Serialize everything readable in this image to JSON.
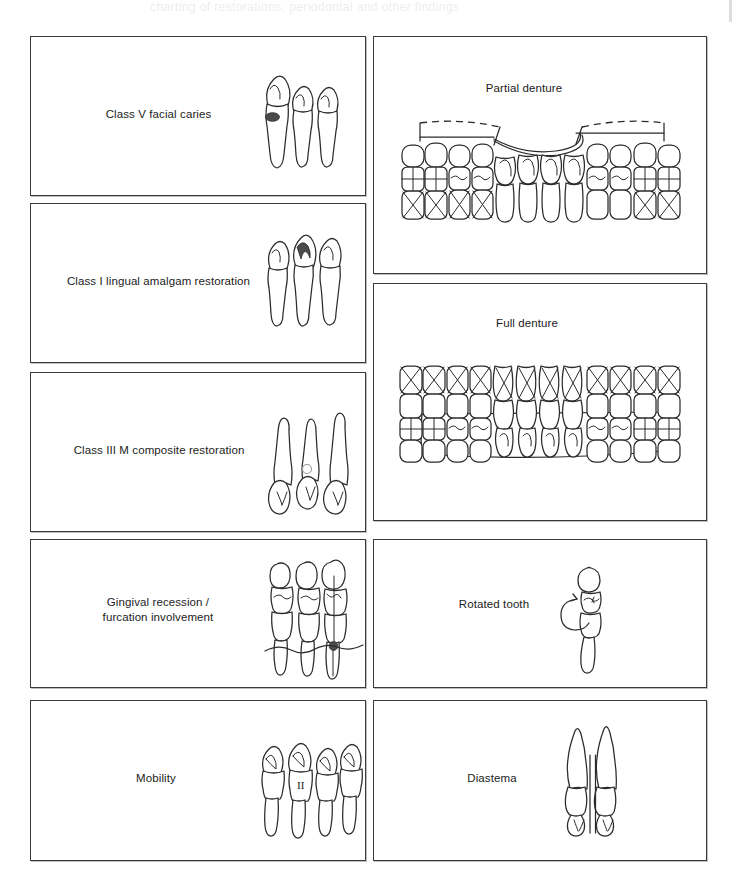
{
  "page": {
    "background_color": "#ffffff",
    "ink_color": "#2b2b2b",
    "ghost_header_artifact": "charting of restorations, periodontal and other findings",
    "panel_border_color": "#3a3a3a"
  },
  "panels": [
    {
      "id": "class-v-facial-caries",
      "label": "Class V facial caries",
      "column": "left",
      "art": "three-anterior-teeth-facial-lesion",
      "marking": {
        "type": "filled-lesion",
        "color": "#4a4a4a",
        "tooth_index": 1,
        "position": "cervical-facial"
      },
      "tooth_count": 3
    },
    {
      "id": "class-i-lingual-amalgam-restoration",
      "label": "Class I lingual amalgam restoration",
      "column": "left",
      "art": "three-anterior-teeth-lingual-amalgam",
      "marking": {
        "type": "filled-occlusal-outline",
        "color": "#4a4a4a",
        "tooth_index": 2,
        "position": "lingual-fossa"
      },
      "tooth_count": 3
    },
    {
      "id": "class-iii-m-composite-restoration",
      "label": "Class III M composite restoration",
      "column": "left",
      "art": "three-inverted-anterior-teeth-mesial-composite",
      "marking": {
        "type": "outline-circle",
        "color": "#9a9a9a",
        "tooth_index": 2,
        "position": "mesial"
      },
      "tooth_count": 3
    },
    {
      "id": "gingival-recession-furcation-involvement",
      "label": "Gingival recession /\nfurcation involvement",
      "column": "left",
      "art": "three-posterior-teeth-recession-line-and-furcation-dot",
      "marking": {
        "type": "filled-dot",
        "color": "#4a4a4a",
        "tooth_index": 3,
        "position": "furcation"
      },
      "tooth_count": 3
    },
    {
      "id": "mobility",
      "label": "Mobility",
      "column": "left",
      "art": "four-anterior-teeth-with-roman-numeral",
      "marking": {
        "type": "roman-numeral",
        "value": "II",
        "tooth_index": 2
      },
      "tooth_count": 4
    },
    {
      "id": "partial-denture",
      "label": "Partial denture",
      "column": "right",
      "art": "full-arch-with-two-dashed-span-brackets",
      "marking": {
        "type": "dashed-span-bracket",
        "segments": 2,
        "position": "posterior-left-and-right"
      },
      "tooth_count": 14
    },
    {
      "id": "full-denture",
      "label": "Full denture",
      "column": "right",
      "art": "full-arch-all-teeth-crossed-with-enclosing-outline",
      "marking": {
        "type": "x-cross-all-plus-outline",
        "segments": 1
      },
      "tooth_count": 14
    },
    {
      "id": "rotated-tooth",
      "label": "Rotated tooth",
      "column": "right",
      "art": "single-tooth-with-curved-rotation-arrow",
      "marking": {
        "type": "curved-arrow",
        "direction": "counter-clockwise"
      },
      "tooth_count": 1
    },
    {
      "id": "diastema",
      "label": "Diastema",
      "column": "right",
      "art": "two-inverted-anterior-teeth-with-parallel-gap-lines",
      "marking": {
        "type": "parallel-vertical-lines",
        "count": 2,
        "position": "interproximal-midline"
      },
      "tooth_count": 2
    }
  ]
}
